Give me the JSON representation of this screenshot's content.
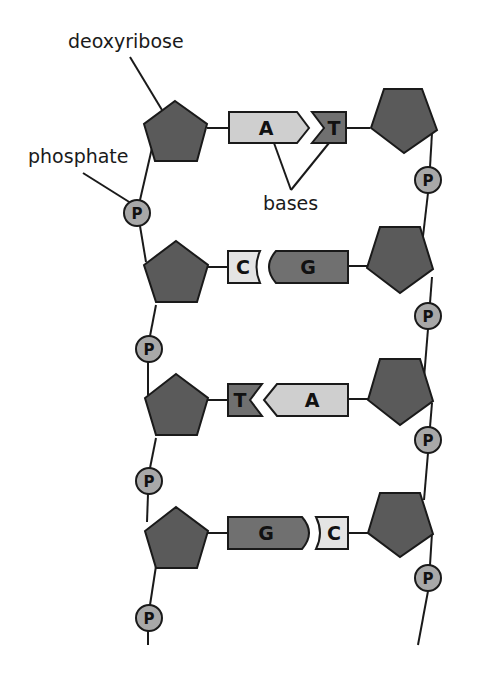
{
  "labels": {
    "deoxyribose": "deoxyribose",
    "phosphate": "phosphate",
    "bases": "bases"
  },
  "phosphate_symbol": "P",
  "base_pairs": [
    {
      "left": "A",
      "right": "T"
    },
    {
      "left": "C",
      "right": "G"
    },
    {
      "left": "T",
      "right": "A"
    },
    {
      "left": "G",
      "right": "C"
    }
  ],
  "colors": {
    "sugar": "#5a5a5a",
    "phosphate": "#a8a8a8",
    "purine_light": "#cfcfcf",
    "base_dark": "#707070",
    "outline": "#1a1a1a"
  }
}
